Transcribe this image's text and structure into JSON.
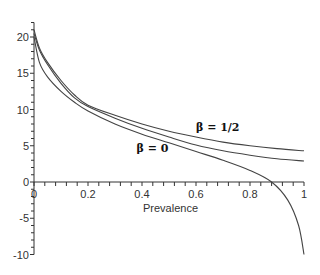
{
  "chart_data": {
    "type": "line",
    "title": "",
    "xlabel": "Prevalence",
    "ylabel": "",
    "xlim": [
      0,
      1
    ],
    "ylim": [
      -10,
      22
    ],
    "grid": false,
    "x_ticks": [
      "0",
      "0.2",
      "0.4",
      "0.6",
      "0.8",
      "1"
    ],
    "y_ticks": [
      "-10",
      "-5",
      "0",
      "5",
      "10",
      "15",
      "20"
    ],
    "annotations": [
      {
        "text": "β = 1/2",
        "x": 0.6,
        "y": 7
      },
      {
        "text": "β = 0",
        "x": 0.38,
        "y": 4.2
      }
    ],
    "series": [
      {
        "name": "β = 1/2",
        "x": [
          0,
          0.02,
          0.05,
          0.1,
          0.15,
          0.2,
          0.3,
          0.4,
          0.5,
          0.6,
          0.7,
          0.8,
          0.9,
          1.0
        ],
        "values": [
          21,
          18.5,
          16.5,
          14,
          12,
          10.6,
          9.2,
          8.0,
          7.0,
          6.2,
          5.5,
          5.0,
          4.6,
          4.3
        ]
      },
      {
        "name": "β = 0",
        "x": [
          0,
          0.02,
          0.05,
          0.1,
          0.15,
          0.2,
          0.3,
          0.4,
          0.5,
          0.6,
          0.7,
          0.8,
          0.9,
          1.0
        ],
        "values": [
          20.5,
          18.2,
          16.2,
          13.6,
          11.6,
          10.4,
          8.8,
          7.4,
          6.2,
          5.1,
          4.3,
          3.7,
          3.2,
          2.9
        ]
      },
      {
        "name": "third curve",
        "x": [
          0,
          0.02,
          0.05,
          0.1,
          0.15,
          0.2,
          0.3,
          0.4,
          0.5,
          0.6,
          0.7,
          0.8,
          0.88,
          0.94,
          0.98,
          1.0
        ],
        "values": [
          20,
          16.5,
          14.5,
          12.5,
          11,
          9.8,
          8.0,
          6.6,
          5.4,
          4.2,
          3.0,
          1.6,
          0,
          -2.5,
          -6,
          -10
        ]
      }
    ]
  }
}
